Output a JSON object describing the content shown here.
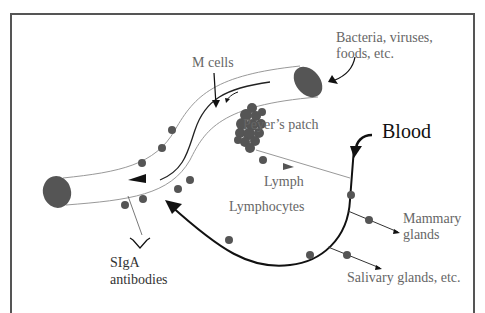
{
  "labels": {
    "bacteria_line1": "Bacteria, viruses,",
    "bacteria_line2": "foods, etc.",
    "m_cells": "M cells",
    "peyers_patch": "Peyer’s patch",
    "blood": "Blood",
    "lymph": "Lymph",
    "lymphocytes": "Lymphocytes",
    "mammary_line1": "Mammary",
    "mammary_line2": "glands",
    "siga_line1": "SIgA",
    "siga_line2": "antibodies",
    "salivary": "Salivary glands, etc."
  },
  "colors": {
    "cell": "#555555",
    "tube_line": "#888888",
    "blood_line": "#111111",
    "text": "#666666"
  }
}
